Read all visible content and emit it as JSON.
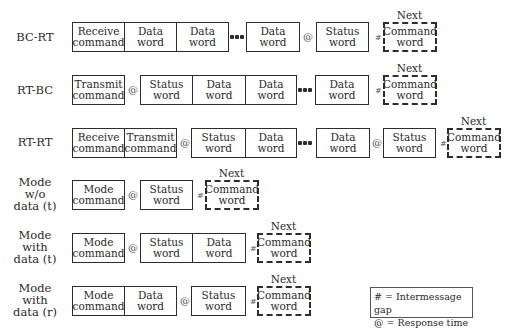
{
  "rows": [
    {
      "label": "BC-RT",
      "words": [
        "Receive command",
        "Data word",
        "Data word",
        "Data word",
        "Status word"
      ],
      "next": {
        "label": "Next",
        "word": "Command word"
      }
    },
    {
      "label": "RT-BC",
      "words": [
        "Transmit command",
        "Status word",
        "Data word",
        "Data word",
        "Data word"
      ],
      "next": {
        "label": "Next",
        "word": "Command word"
      }
    },
    {
      "label": "RT-RT",
      "words": [
        "Receive command",
        "Transmit command",
        "Status word",
        "Data word",
        "Data word",
        "Status word"
      ],
      "next": {
        "label": "Next",
        "word": "Command word"
      }
    },
    {
      "label": "Mode w/o data (t)",
      "words": [
        "Mode command",
        "Status word"
      ],
      "next": {
        "label": "Next",
        "word": "Command word"
      }
    },
    {
      "label": "Mode with data (t)",
      "words": [
        "Mode command",
        "Status word",
        "Data word"
      ],
      "next": {
        "label": "Next",
        "word": "Command word"
      }
    },
    {
      "label": "Mode with data (r)",
      "words": [
        "Mode command",
        "Data word",
        "Status word"
      ],
      "next": {
        "label": "Next",
        "word": "Command word"
      }
    }
  ],
  "symbols": {
    "gap": "#",
    "response": "@"
  },
  "legend": {
    "gap": "# = Intermessage gap",
    "response": "@ = Response time"
  },
  "text": {
    "receive1": "Receive",
    "receive2": "command",
    "transmit1": "Transmit",
    "transmit2": "command",
    "mode1": "Mode",
    "mode2": "command",
    "data1": "Data",
    "data2": "word",
    "status1": "Status",
    "status2": "word",
    "cmd1": "Command",
    "cmd2": "word",
    "next": "Next",
    "l1": "BC-RT",
    "l2": "RT-BC",
    "l3": "RT-RT",
    "l4a": "Mode",
    "l4b": "w/o",
    "l4c": "data (t)",
    "l5a": "Mode",
    "l5b": "with",
    "l5c": "data (t)",
    "l6a": "Mode",
    "l6b": "with",
    "l6c": "data (r)"
  }
}
